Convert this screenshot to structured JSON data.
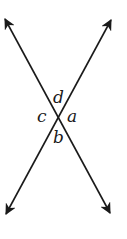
{
  "diagram": {
    "type": "intersecting-lines",
    "line_color": "#1a1a1a",
    "background": "#ffffff",
    "lines": [
      {
        "name": "line-1",
        "from": [
          5,
          19
        ],
        "to": [
          110,
          213
        ]
      },
      {
        "name": "line-2",
        "from": [
          111,
          20
        ],
        "to": [
          6,
          214
        ]
      }
    ],
    "intersection": [
      59,
      117
    ],
    "labels": [
      {
        "text": "d",
        "x": 53,
        "y": 103
      },
      {
        "text": "c",
        "x": 37,
        "y": 122
      },
      {
        "text": "a",
        "x": 67,
        "y": 122
      },
      {
        "text": "b",
        "x": 53,
        "y": 143
      }
    ]
  }
}
